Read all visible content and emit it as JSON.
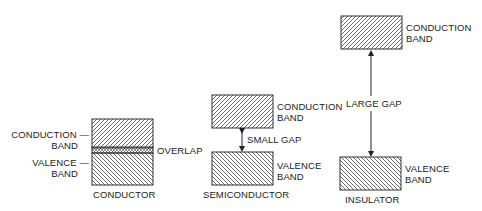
{
  "diagram": {
    "conductor": {
      "title": "CONDUCTOR",
      "conduction_label_1": "CONDUCTION —",
      "conduction_label_2": "BAND",
      "valence_label_1": "VALENCE —",
      "valence_label_2": "BAND",
      "overlap_label": "OVERLAP"
    },
    "semiconductor": {
      "title": "SEMICONDUCTOR",
      "conduction_label_1": "CONDUCTION",
      "conduction_label_2": "BAND",
      "valence_label_1": "VALENCE",
      "valence_label_2": "BAND",
      "gap_label": "SMALL GAP"
    },
    "insulator": {
      "title": "INSULATOR",
      "conduction_label_1": "CONDUCTION",
      "conduction_label_2": "BAND",
      "valence_label_1": "VALENCE",
      "valence_label_2": "BAND",
      "gap_label": "LARGE GAP"
    },
    "colors": {
      "stroke": "#333333",
      "background": "#ffffff"
    }
  }
}
